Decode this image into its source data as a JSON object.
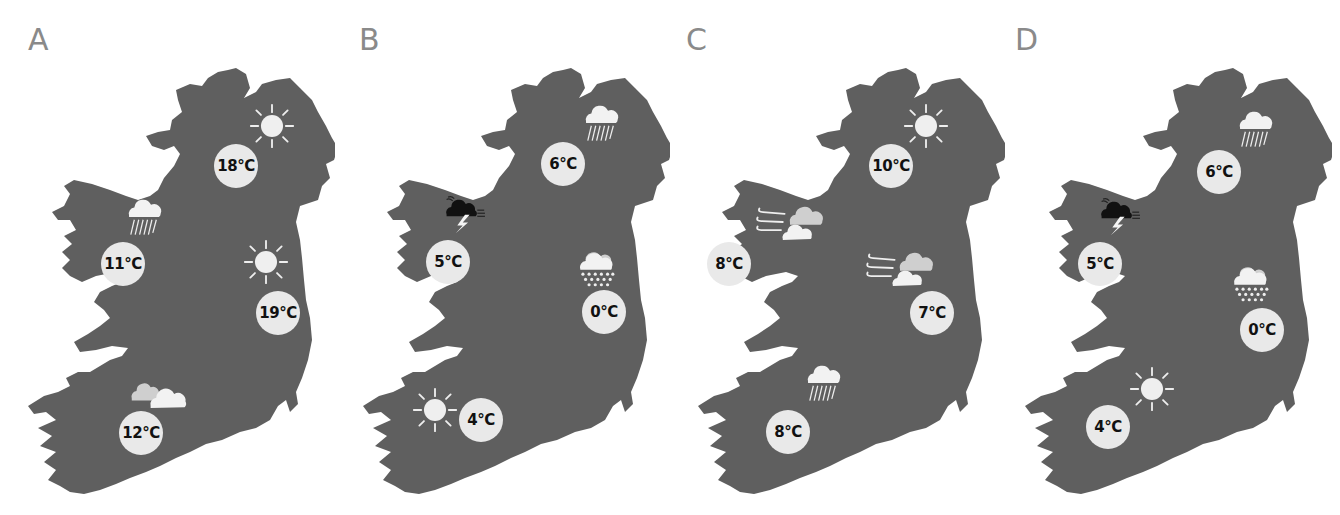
{
  "colors": {
    "land": "#5f5f5f",
    "badge": "#e9e9e9",
    "badge_text": "#111111",
    "label": "#8a8a8a",
    "icon_light": "#f2f2f2",
    "icon_mid": "#cfcfcf",
    "thunder_cloud": "#111111"
  },
  "panels": [
    {
      "label": "A",
      "locations": [
        {
          "region": "north-east",
          "icon": "sun-icon",
          "temp": "18°C"
        },
        {
          "region": "west",
          "icon": "rain-cloud-icon",
          "temp": "11°C"
        },
        {
          "region": "east",
          "icon": "sun-icon",
          "temp": "19°C"
        },
        {
          "region": "south-west",
          "icon": "partly-cloudy-icon",
          "temp": "12°C"
        }
      ]
    },
    {
      "label": "B",
      "locations": [
        {
          "region": "north-east",
          "icon": "rain-cloud-icon",
          "temp": "6°C"
        },
        {
          "region": "west",
          "icon": "thunderstorm-icon",
          "temp": "5°C"
        },
        {
          "region": "east",
          "icon": "snow-cloud-icon",
          "temp": "0°C"
        },
        {
          "region": "south-west",
          "icon": "sun-icon",
          "temp": "4°C"
        }
      ]
    },
    {
      "label": "C",
      "locations": [
        {
          "region": "north-east",
          "icon": "sun-icon",
          "temp": "10°C"
        },
        {
          "region": "west",
          "icon": "windy-cloud-icon",
          "temp": "8°C"
        },
        {
          "region": "east",
          "icon": "windy-cloud-icon",
          "temp": "7°C"
        },
        {
          "region": "south-west",
          "icon": "rain-cloud-icon",
          "temp": "8°C"
        }
      ]
    },
    {
      "label": "D",
      "locations": [
        {
          "region": "north-east",
          "icon": "rain-cloud-icon",
          "temp": "6°C"
        },
        {
          "region": "west",
          "icon": "thunderstorm-icon",
          "temp": "5°C"
        },
        {
          "region": "east",
          "icon": "snow-cloud-icon",
          "temp": "0°C"
        },
        {
          "region": "south-west",
          "icon": "sun-icon",
          "temp": "4°C"
        }
      ]
    }
  ]
}
